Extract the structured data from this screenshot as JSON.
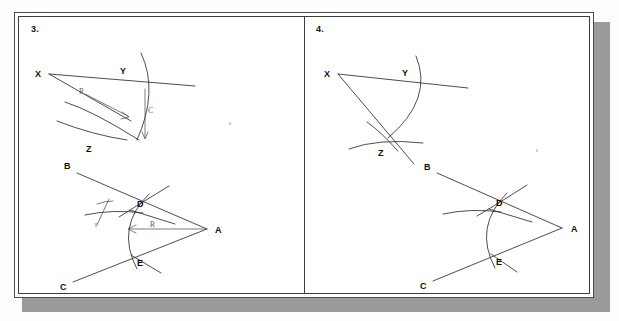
{
  "figure": {
    "background_color": "#ffffff",
    "ink_color": "#2d2d2d",
    "shadow_color": "#9a9a9a",
    "frame_color": "#3c3c3c"
  },
  "panels": [
    {
      "number": "3.",
      "name": "panel-3",
      "diagrams": [
        {
          "name": "angle-xyz-with-arcs",
          "labels": [
            {
              "text": "X",
              "kind": "point"
            },
            {
              "text": "Y",
              "kind": "point"
            },
            {
              "text": "Z",
              "kind": "point"
            },
            {
              "text": "R",
              "kind": "dimension"
            },
            {
              "text": "C",
              "kind": "dimension"
            }
          ]
        },
        {
          "name": "angle-bac-with-arcs",
          "labels": [
            {
              "text": "B",
              "kind": "point"
            },
            {
              "text": "C",
              "kind": "point"
            },
            {
              "text": "A",
              "kind": "point"
            },
            {
              "text": "D",
              "kind": "point"
            },
            {
              "text": "E",
              "kind": "point"
            },
            {
              "text": "r",
              "kind": "dimension"
            },
            {
              "text": "R",
              "kind": "dimension"
            }
          ]
        }
      ]
    },
    {
      "number": "4.",
      "name": "panel-4",
      "diagrams": [
        {
          "name": "angle-xyz-bisected",
          "labels": [
            {
              "text": "X",
              "kind": "point"
            },
            {
              "text": "Y",
              "kind": "point"
            },
            {
              "text": "Z",
              "kind": "point"
            }
          ]
        },
        {
          "name": "angle-bac-arcs-plain",
          "labels": [
            {
              "text": "B",
              "kind": "point"
            },
            {
              "text": "C",
              "kind": "point"
            },
            {
              "text": "A",
              "kind": "point"
            },
            {
              "text": "D",
              "kind": "point"
            },
            {
              "text": "E",
              "kind": "point"
            }
          ]
        }
      ]
    }
  ]
}
